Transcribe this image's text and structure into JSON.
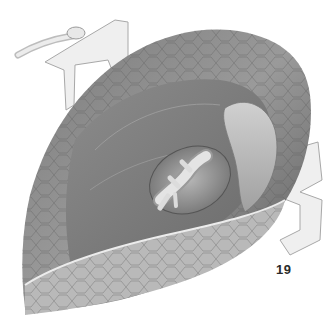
{
  "figure": {
    "number": "19",
    "style": "grayscale anatomical pencil illustration",
    "colors": {
      "background": "#ffffff",
      "tissue_dark": "#4a4a4a",
      "tissue_mid": "#8a8a8a",
      "tissue_light": "#c8c8c8",
      "retractor": "#e6e6e6",
      "vessel": "#d9d9d9"
    }
  }
}
